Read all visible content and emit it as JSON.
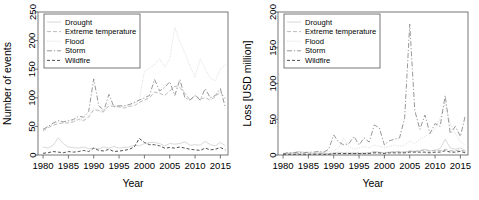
{
  "figure": {
    "panels": [
      {
        "id": "events-panel",
        "xlabel": "Year",
        "ylabel": "Number of events",
        "ylim": [
          0,
          250
        ],
        "yticks": [
          "0",
          "50",
          "100",
          "150",
          "200",
          "250"
        ],
        "xlim": [
          1979,
          2016.5
        ],
        "xticks": [
          "1980",
          "1985",
          "1990",
          "1995",
          "2000",
          "2005",
          "2010",
          "2015"
        ]
      },
      {
        "id": "loss-panel",
        "xlabel": "Year",
        "ylabel": "Loss [USD million]",
        "ylim": [
          0,
          200
        ],
        "yticks": [
          "0",
          "50",
          "100",
          "150",
          "200"
        ],
        "xlim": [
          1979,
          2016.5
        ],
        "xticks": [
          "1980",
          "1985",
          "1990",
          "1995",
          "2000",
          "2005",
          "2010",
          "2015"
        ]
      }
    ],
    "legend": {
      "position": "top-left",
      "entries": [
        {
          "label": "Drought",
          "color": "#d4d4d4",
          "dash": "none"
        },
        {
          "label": "Extreme temperature",
          "color": "#b4b4b4",
          "dash": "4,2"
        },
        {
          "label": "Flood",
          "color": "#dcdcdc",
          "dash": "1.2,1.2"
        },
        {
          "label": "Storm",
          "color": "#8c8c8c",
          "dash": "5,2,1.2,2"
        },
        {
          "label": "Wildfire",
          "color": "#3c3c3c",
          "dash": "3,2"
        }
      ]
    }
  },
  "chart_data": [
    {
      "type": "line",
      "title": "",
      "xlabel": "Year",
      "ylabel": "Number of events",
      "xlim": [
        1979,
        2016.5
      ],
      "ylim": [
        0,
        250
      ],
      "grid": false,
      "legend_position": "top-left",
      "x": [
        1980,
        1981,
        1982,
        1983,
        1984,
        1985,
        1986,
        1987,
        1988,
        1989,
        1990,
        1991,
        1992,
        1993,
        1994,
        1995,
        1996,
        1997,
        1998,
        1999,
        2000,
        2001,
        2002,
        2003,
        2004,
        2005,
        2006,
        2007,
        2008,
        2009,
        2010,
        2011,
        2012,
        2013,
        2014,
        2015,
        2016
      ],
      "series": [
        {
          "name": "Drought",
          "color": "#d4d4d4",
          "dash": "none",
          "values": [
            14,
            12,
            17,
            30,
            20,
            14,
            13,
            12,
            14,
            11,
            12,
            11,
            14,
            12,
            15,
            12,
            13,
            14,
            17,
            16,
            20,
            22,
            22,
            20,
            16,
            20,
            19,
            20,
            23,
            17,
            18,
            17,
            24,
            18,
            16,
            22,
            16
          ]
        },
        {
          "name": "Extreme temperature",
          "color": "#b4b4b4",
          "dash": "4,2",
          "values": [
            42,
            48,
            52,
            55,
            56,
            56,
            58,
            62,
            60,
            66,
            79,
            78,
            76,
            86,
            85,
            84,
            82,
            85,
            86,
            92,
            96,
            100,
            110,
            108,
            104,
            112,
            120,
            118,
            108,
            96,
            104,
            98,
            100,
            96,
            102,
            110,
            98
          ]
        },
        {
          "name": "Flood",
          "color": "#dcdcdc",
          "dash": "1.2,1.2",
          "values": [
            44,
            50,
            54,
            58,
            56,
            58,
            60,
            64,
            62,
            68,
            82,
            76,
            74,
            92,
            86,
            86,
            84,
            88,
            90,
            96,
            146,
            152,
            158,
            168,
            154,
            168,
            223,
            198,
            178,
            156,
            136,
            168,
            150,
            134,
            130,
            150,
            158
          ]
        },
        {
          "name": "Storm",
          "color": "#8c8c8c",
          "dash": "5,2,1.2,2",
          "values": [
            45,
            50,
            56,
            60,
            58,
            60,
            62,
            68,
            66,
            76,
            133,
            86,
            78,
            106,
            84,
            86,
            86,
            88,
            92,
            96,
            100,
            104,
            132,
            112,
            118,
            128,
            104,
            132,
            100,
            96,
            104,
            96,
            116,
            100,
            104,
            116,
            82
          ]
        },
        {
          "name": "Wildfire",
          "color": "#3c3c3c",
          "dash": "3,2",
          "values": [
            3,
            4,
            6,
            5,
            4,
            6,
            5,
            6,
            8,
            6,
            12,
            8,
            7,
            10,
            6,
            7,
            8,
            10,
            14,
            29,
            22,
            18,
            18,
            16,
            12,
            13,
            12,
            14,
            12,
            10,
            9,
            8,
            12,
            9,
            10,
            13,
            9
          ]
        }
      ]
    },
    {
      "type": "line",
      "title": "",
      "xlabel": "Year",
      "ylabel": "Loss [USD million]",
      "xlim": [
        1979,
        2016.5
      ],
      "ylim": [
        0,
        200
      ],
      "grid": false,
      "legend_position": "top-left",
      "x": [
        1980,
        1981,
        1982,
        1983,
        1984,
        1985,
        1986,
        1987,
        1988,
        1989,
        1990,
        1991,
        1992,
        1993,
        1994,
        1995,
        1996,
        1997,
        1998,
        1999,
        2000,
        2001,
        2002,
        2003,
        2004,
        2005,
        2006,
        2007,
        2008,
        2009,
        2010,
        2011,
        2012,
        2013,
        2014,
        2015,
        2016
      ],
      "series": [
        {
          "name": "Drought",
          "color": "#d4d4d4",
          "dash": "none",
          "values": [
            2,
            3,
            3,
            5,
            4,
            3,
            2,
            3,
            3,
            2,
            3,
            4,
            3,
            3,
            3,
            2,
            3,
            3,
            5,
            4,
            3,
            4,
            5,
            4,
            4,
            6,
            5,
            6,
            8,
            6,
            6,
            9,
            22,
            10,
            8,
            10,
            6
          ]
        },
        {
          "name": "Extreme temperature",
          "color": "#b4b4b4",
          "dash": "4,2",
          "values": [
            1,
            1,
            1,
            2,
            1,
            1,
            1,
            2,
            2,
            1,
            2,
            2,
            2,
            2,
            2,
            3,
            2,
            3,
            4,
            3,
            3,
            4,
            4,
            5,
            4,
            5,
            5,
            6,
            7,
            5,
            7,
            6,
            8,
            6,
            6,
            7,
            5
          ]
        },
        {
          "name": "Flood",
          "color": "#dcdcdc",
          "dash": "1.2,1.2",
          "values": [
            2,
            2,
            3,
            3,
            3,
            3,
            3,
            4,
            4,
            5,
            6,
            10,
            24,
            12,
            8,
            10,
            12,
            10,
            14,
            12,
            10,
            12,
            14,
            12,
            14,
            20,
            16,
            22,
            26,
            30,
            36,
            52,
            72,
            44,
            30,
            18,
            14
          ]
        },
        {
          "name": "Storm",
          "color": "#8c8c8c",
          "dash": "5,2,1.2,2",
          "values": [
            2,
            3,
            3,
            4,
            3,
            4,
            4,
            5,
            4,
            8,
            28,
            18,
            14,
            16,
            26,
            14,
            24,
            18,
            42,
            38,
            14,
            20,
            22,
            24,
            52,
            183,
            62,
            36,
            56,
            30,
            44,
            40,
            83,
            30,
            40,
            26,
            56
          ]
        },
        {
          "name": "Wildfire",
          "color": "#3c3c3c",
          "dash": "3,2",
          "values": [
            1,
            1,
            1,
            1,
            1,
            1,
            1,
            1,
            1,
            1,
            2,
            2,
            2,
            2,
            2,
            2,
            2,
            2,
            3,
            3,
            2,
            3,
            3,
            3,
            3,
            4,
            4,
            4,
            4,
            3,
            4,
            4,
            6,
            4,
            4,
            5,
            3
          ]
        }
      ]
    }
  ]
}
